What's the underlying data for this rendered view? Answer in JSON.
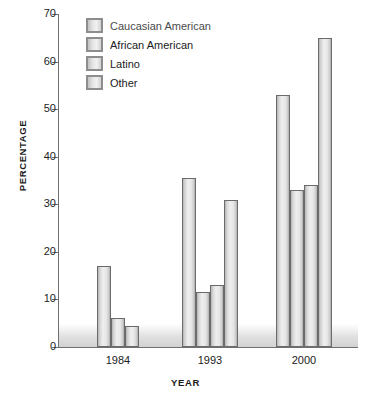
{
  "chart_data": {
    "type": "bar",
    "title": "",
    "xlabel": "YEAR",
    "ylabel": "PERCENTAGE",
    "categories": [
      "1984",
      "1993",
      "2000"
    ],
    "ylim": [
      0,
      70
    ],
    "ytick_labels": [
      "0",
      "10",
      "20",
      "30",
      "40",
      "50",
      "60",
      "70"
    ],
    "ytick_values": [
      0,
      10,
      20,
      30,
      40,
      50,
      60,
      70
    ],
    "grid": false,
    "legend_position": "top-left",
    "series": [
      {
        "name": "Caucasian American",
        "values": [
          17,
          35.5,
          53
        ]
      },
      {
        "name": "African American",
        "values": [
          6,
          11.5,
          33
        ]
      },
      {
        "name": "Latino",
        "values": [
          4.5,
          13,
          34
        ]
      },
      {
        "name": "Other",
        "values": [
          null,
          31,
          65
        ]
      }
    ],
    "colors": {
      "bar_fill_light": "#efefef",
      "bar_fill_dark": "#a9a9a9",
      "bar_border": "#6b6b6b",
      "axis": "#6f6f6f",
      "text": "#1b1b1b"
    }
  },
  "legend": {
    "items": [
      {
        "label": "Caucasian American"
      },
      {
        "label": "African American"
      },
      {
        "label": "Latino"
      },
      {
        "label": "Other"
      }
    ]
  }
}
